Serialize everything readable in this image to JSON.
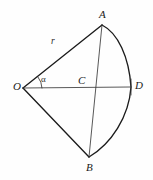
{
  "figure": {
    "kind": "geometry-diagram",
    "background_color": "#fefefe",
    "stroke_color": "#1b1b1b",
    "thin_stroke_color": "#3a3a3a",
    "labels": {
      "point_a": "A",
      "point_b": "B",
      "point_c": "C",
      "point_d": "D",
      "point_o": "O",
      "radius": "r",
      "angle": "α"
    },
    "points": {
      "O": {
        "x": 23,
        "y": 88
      },
      "A": {
        "x": 102,
        "y": 25
      },
      "B": {
        "x": 89,
        "y": 157
      },
      "C": {
        "x": 94,
        "y": 87
      },
      "D": {
        "x": 131,
        "y": 87
      }
    },
    "segments": [
      {
        "name": "radius-OA",
        "from": "O",
        "to": "A",
        "weight": "thick"
      },
      {
        "name": "radius-OB",
        "from": "O",
        "to": "B",
        "weight": "thick"
      },
      {
        "name": "axis-OD",
        "from": "O",
        "to": "D",
        "weight": "thin"
      },
      {
        "name": "chord-AB",
        "from": "A",
        "to": "B",
        "weight": "thin"
      }
    ],
    "arcs": [
      {
        "name": "sector-arc-ADB",
        "from": "A",
        "through": "D",
        "to": "B",
        "weight": "thick"
      },
      {
        "name": "angle-mark-at-O",
        "center": "O",
        "radius": 19,
        "weight": "thin"
      }
    ]
  }
}
